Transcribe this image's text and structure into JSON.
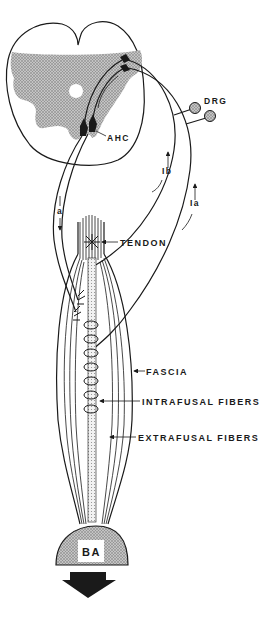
{
  "diagram": {
    "title": "",
    "labels": {
      "ahc": "AHC",
      "drg": "DRG",
      "ib": "Ib",
      "ia": "Ia",
      "a": "a",
      "tendon": "TENDON",
      "fascia": "FASCIA",
      "intrafusal": "INTRAFUSAL FIBERS",
      "extrafusal": "EXTRAFUSAL FIBERS",
      "ba": "BA"
    },
    "colors": {
      "ink": "#1a1a1a",
      "gray_matter": "#9a9a9a",
      "bone": "#a8a8a8",
      "background": "#ffffff"
    },
    "components": [
      "spinal-cord-cross-section",
      "gray-matter",
      "central-canal",
      "anterior-horn-cells",
      "dorsal-root-ganglia",
      "afferent-fiber-Ia",
      "afferent-fiber-Ib",
      "efferent-fiber-a",
      "tendon",
      "muscle-belly",
      "fascia",
      "intrafusal-fibers",
      "extrafusal-fibers",
      "bone-attachment",
      "force-arrow"
    ]
  }
}
